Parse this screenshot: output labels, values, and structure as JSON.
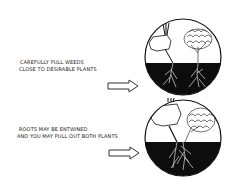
{
  "steps": [
    {
      "caption_lines": [
        "Carefully pull weeds",
        "close to desirable plants"
      ],
      "illustration": "hand pulling weed next to desirable plant, roots separate"
    },
    {
      "caption_lines": [
        "Roots may be entwined",
        "and you may pull out both plants"
      ],
      "illustration": "hand pulling weed with roots entwined with desirable plant"
    }
  ],
  "colors": {
    "ink": "#111111",
    "soil": "#0d0d0d",
    "paper": "#ffffff"
  },
  "icons": {
    "arrow": "outline-right-arrow"
  }
}
